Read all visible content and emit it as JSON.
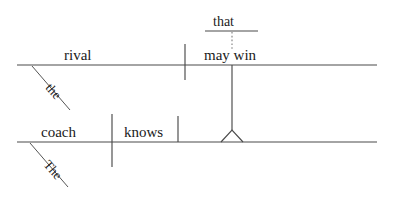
{
  "diagram": {
    "type": "reed-kellogg-sentence-diagram",
    "sentence": "The coach knows the rival that may win.",
    "canvas": {
      "width": 395,
      "height": 197,
      "background": "#ffffff"
    },
    "colors": {
      "line": "#4a4a4a",
      "dotted_line": "#7d7d7d",
      "text": "#1a1a1a",
      "background": "#ffffff"
    },
    "clauses": {
      "main": {
        "name": "main-clause",
        "baseline": {
          "x1": 17,
          "y": 142,
          "x2": 377
        },
        "subject": {
          "label": "coach",
          "x": 64,
          "y": 136
        },
        "verb": {
          "label": "knows",
          "x": 145,
          "y": 136
        },
        "subject_verb_divider": {
          "x": 112,
          "y1": 114,
          "y2": 167
        },
        "verb_object_divider": {
          "x": 178,
          "y1": 116,
          "y2": 142
        },
        "modifier": {
          "label": "The",
          "attaches_to": "coach",
          "slant": {
            "x1": 30,
            "y1": 143,
            "x2": 68,
            "y2": 187
          }
        }
      },
      "relative": {
        "name": "relative-clause",
        "baseline": {
          "x1": 17,
          "y": 65,
          "x2": 377
        },
        "subject": {
          "label": "rival",
          "x": 64,
          "y": 59
        },
        "verb": {
          "label": "may win",
          "x": 205,
          "y": 59
        },
        "subject_verb_divider": {
          "x": 185,
          "y1": 44,
          "y2": 80
        },
        "modifier": {
          "label": "the",
          "attaches_to": "rival",
          "slant": {
            "x1": 32,
            "y1": 66,
            "x2": 70,
            "y2": 110
          }
        },
        "relative_pronoun": {
          "label": "that",
          "baseline": {
            "x1": 205,
            "y": 31,
            "x2": 258
          },
          "text_x": 213,
          "text_y": 25,
          "connector": {
            "x": 232,
            "y1": 31,
            "y2": 48,
            "style": "dotted"
          }
        }
      }
    },
    "connector": {
      "name": "relative-clause-connector",
      "stem": {
        "x": 232,
        "y1": 65,
        "y2": 130
      },
      "tripod": {
        "apex_x": 232,
        "apex_y": 130,
        "left_x": 221,
        "right_x": 243,
        "base_y": 142
      }
    },
    "labels": {
      "that": "that",
      "rival": "rival",
      "may_win": "may win",
      "the_lower": "the",
      "coach": "coach",
      "knows": "knows",
      "The_upper": "The"
    }
  }
}
